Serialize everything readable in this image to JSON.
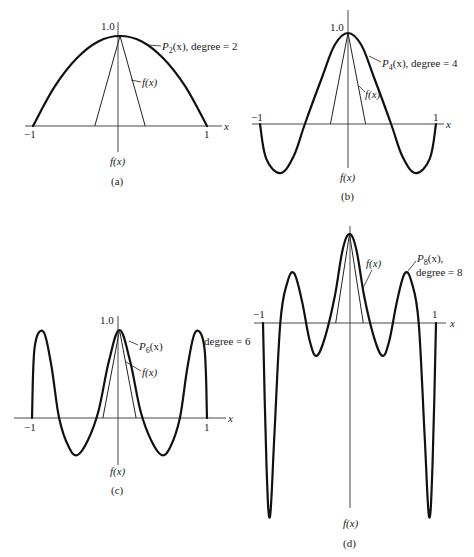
{
  "figure": {
    "panels": [
      {
        "id": "a",
        "caption": "(a)",
        "poly_label": "P",
        "poly_sub": "2",
        "poly_suffix": "(x), degree = 2",
        "f_label": "f(x)",
        "f_axis_label": "f(x)",
        "peak_label": "1.0",
        "x_label": "x",
        "tick_neg": "−1",
        "tick_pos": "1"
      },
      {
        "id": "b",
        "caption": "(b)",
        "poly_label": "P",
        "poly_sub": "4",
        "poly_suffix": "(x), degree = 4",
        "f_label": "f(x)",
        "f_axis_label": "f(x)",
        "peak_label": "1.0",
        "x_label": "x",
        "tick_neg": "−1",
        "tick_pos": "1"
      },
      {
        "id": "c",
        "caption": "(c)",
        "poly_label": "P",
        "poly_sub": "6",
        "poly_suffix": "(x)",
        "degree_label": "degree = 6",
        "f_label": "f(x)",
        "f_axis_label": "f(x)",
        "peak_label": "1.0",
        "x_label": "x",
        "tick_neg": "−1",
        "tick_pos": "1"
      },
      {
        "id": "d",
        "caption": "(d)",
        "poly_label": "P",
        "poly_sub": "8",
        "poly_suffix": "(x),",
        "degree_label": "degree = 8",
        "f_label": "f(x)",
        "f_axis_label": "f(x)",
        "x_label": "x",
        "tick_neg": "−1",
        "tick_pos": "1"
      }
    ]
  },
  "chart_data": [
    {
      "type": "line",
      "title": "(a)",
      "xlabel": "x",
      "ylabel": "f(x)",
      "xlim": [
        -1,
        1
      ],
      "ylim": [
        0,
        1.0
      ],
      "grid": false,
      "series": [
        {
          "name": "P2(x), degree = 2",
          "x": [
            -1,
            -0.75,
            -0.5,
            -0.25,
            0,
            0.25,
            0.5,
            0.75,
            1
          ],
          "values": [
            0,
            0.44,
            0.75,
            0.94,
            1.0,
            0.94,
            0.75,
            0.44,
            0
          ]
        },
        {
          "name": "f(x)",
          "x": [
            -1,
            -0.29,
            0,
            0.29,
            1
          ],
          "values": [
            0,
            0,
            1.0,
            0,
            0
          ]
        }
      ]
    },
    {
      "type": "line",
      "title": "(b)",
      "xlabel": "x",
      "ylabel": "f(x)",
      "xlim": [
        -1,
        1
      ],
      "ylim": [
        -0.55,
        1.0
      ],
      "grid": false,
      "series": [
        {
          "name": "P4(x), degree = 4",
          "x": [
            -1,
            -0.93,
            -0.77,
            -0.62,
            -0.49,
            -0.3,
            -0.15,
            0,
            0.15,
            0.3,
            0.49,
            0.62,
            0.77,
            0.93,
            1
          ],
          "values": [
            0,
            -0.38,
            -0.54,
            -0.36,
            0,
            0.5,
            0.87,
            1.0,
            0.87,
            0.5,
            0,
            -0.36,
            -0.54,
            -0.38,
            0
          ]
        },
        {
          "name": "f(x)",
          "x": [
            -1,
            -0.2,
            0,
            0.2,
            1
          ],
          "values": [
            0,
            0,
            1.0,
            0,
            0
          ]
        }
      ]
    },
    {
      "type": "line",
      "title": "(c)",
      "xlabel": "x",
      "ylabel": "f(x)",
      "xlim": [
        -1,
        1
      ],
      "ylim": [
        -0.45,
        1.0
      ],
      "grid": false,
      "series": [
        {
          "name": "P6(x), degree = 6",
          "x": [
            -1,
            -0.97,
            -0.87,
            -0.78,
            -0.69,
            -0.58,
            -0.48,
            -0.36,
            -0.24,
            -0.12,
            0,
            0.12,
            0.24,
            0.36,
            0.48,
            0.58,
            0.69,
            0.78,
            0.87,
            0.97,
            1
          ],
          "values": [
            0,
            0.8,
            0.98,
            0.6,
            0,
            -0.33,
            -0.42,
            -0.25,
            0.08,
            0.65,
            1.0,
            0.65,
            0.08,
            -0.25,
            -0.42,
            -0.33,
            0,
            0.6,
            0.98,
            0.8,
            0
          ]
        },
        {
          "name": "f(x)",
          "x": [
            -1,
            -0.19,
            0,
            0.19,
            1
          ],
          "values": [
            0,
            0,
            1.0,
            0,
            0
          ]
        }
      ]
    },
    {
      "type": "line",
      "title": "(d)",
      "xlabel": "x",
      "ylabel": "f(x)",
      "xlim": [
        -1,
        1
      ],
      "ylim": [
        -2.2,
        1.0
      ],
      "grid": false,
      "series": [
        {
          "name": "P8(x), degree = 8",
          "x": [
            -1,
            -0.96,
            -0.92,
            -0.87,
            -0.8,
            -0.72,
            -0.64,
            -0.55,
            -0.46,
            -0.38,
            -0.28,
            -0.17,
            -0.08,
            0,
            0.08,
            0.17,
            0.28,
            0.38,
            0.46,
            0.55,
            0.64,
            0.72,
            0.8,
            0.87,
            0.92,
            0.96,
            1
          ],
          "values": [
            0,
            -1.6,
            -2.18,
            -1.3,
            0,
            0.45,
            0.56,
            0.25,
            -0.2,
            -0.37,
            -0.15,
            0.3,
            0.82,
            1.0,
            0.82,
            0.3,
            -0.15,
            -0.37,
            -0.2,
            0.25,
            0.56,
            0.45,
            0,
            -1.3,
            -2.18,
            -1.6,
            0
          ]
        },
        {
          "name": "f(x)",
          "x": [
            -1,
            -0.16,
            0,
            0.16,
            1
          ],
          "values": [
            0,
            0,
            1.0,
            0,
            0
          ]
        }
      ]
    }
  ]
}
